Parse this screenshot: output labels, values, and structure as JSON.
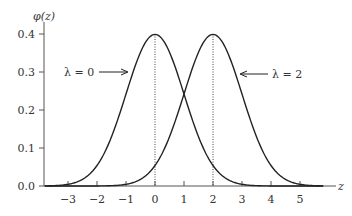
{
  "chart_data": {
    "type": "line",
    "title": "",
    "xlabel": "z",
    "ylabel": "φ(z)",
    "xlim": [
      -3.8,
      5.8
    ],
    "ylim": [
      0.0,
      0.42
    ],
    "x_ticks": [
      -3,
      -2,
      -1,
      0,
      1,
      2,
      3,
      4,
      5
    ],
    "x_tick_labels": [
      "−3",
      "−2",
      "−1",
      "0",
      "1",
      "2",
      "3",
      "4",
      "5"
    ],
    "y_ticks": [
      0.0,
      0.1,
      0.2,
      0.3,
      0.4
    ],
    "y_tick_labels": [
      "0.0",
      "0.1",
      "0.2",
      "0.3",
      "0.4"
    ],
    "grid": false,
    "series": [
      {
        "name": "λ = 0",
        "mean": 0,
        "sd": 1,
        "peak": 0.399,
        "x": [
          -3,
          -2,
          -1,
          0,
          1,
          2,
          3
        ],
        "values": [
          0.004,
          0.054,
          0.242,
          0.399,
          0.242,
          0.054,
          0.004
        ]
      },
      {
        "name": "λ = 2",
        "mean": 2,
        "sd": 1,
        "peak": 0.399,
        "x": [
          -1,
          0,
          1,
          2,
          3,
          4,
          5
        ],
        "values": [
          0.004,
          0.054,
          0.242,
          0.399,
          0.242,
          0.054,
          0.004
        ]
      }
    ],
    "annotations": [
      {
        "text": "λ = 0",
        "arrow_to": "left curve",
        "y": 0.3
      },
      {
        "text": "λ = 2",
        "arrow_to": "right curve",
        "y": 0.3
      }
    ],
    "reference_lines": [
      {
        "type": "vertical-dotted",
        "x": 0
      },
      {
        "type": "vertical-dotted",
        "x": 2
      }
    ]
  },
  "labels": {
    "y_axis": "φ(z)",
    "x_axis": "z",
    "annotation_left": "λ = 0",
    "annotation_right": "λ = 2",
    "y0": "0.0",
    "y1": "0.1",
    "y2": "0.2",
    "y3": "0.3",
    "y4": "0.4",
    "xm3": "−3",
    "xm2": "−2",
    "xm1": "−1",
    "x0": "0",
    "x1": "1",
    "x2": "2",
    "x3": "3",
    "x4": "4",
    "x5": "5"
  }
}
